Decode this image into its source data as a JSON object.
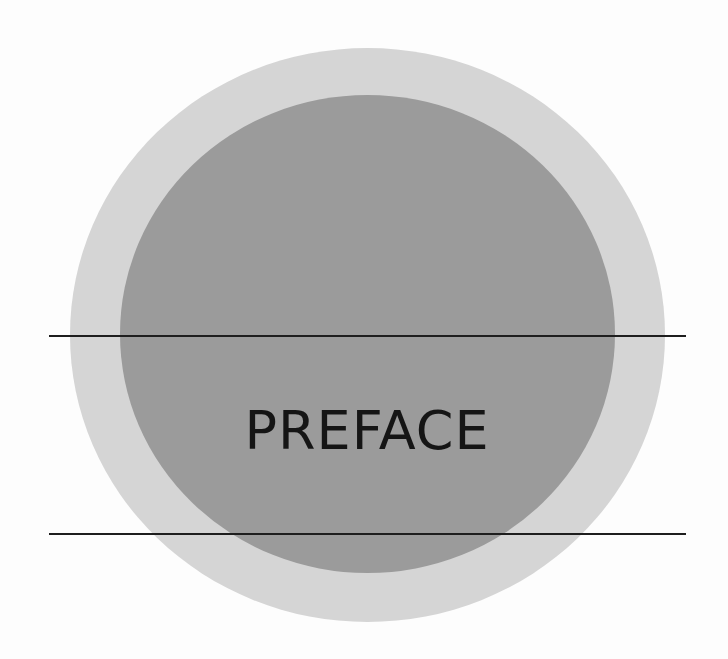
{
  "page": {
    "title": "PREFACE",
    "colors": {
      "background": "#fdfdfd",
      "outer_circle": "#d5d5d5",
      "inner_circle": "#9b9b9b",
      "rules": "#1e1e1e",
      "title_text": "#151515"
    }
  }
}
